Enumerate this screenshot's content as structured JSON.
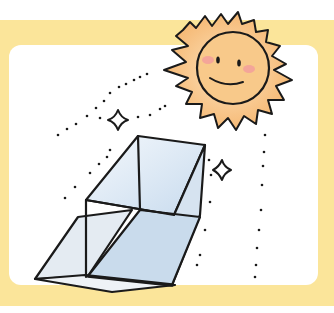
{
  "illustration": {
    "subject": "solar-cooker",
    "elements": [
      "sun",
      "sunlight-rays",
      "sparkles",
      "reflector-box"
    ],
    "colors": {
      "frame": "#fbe59a",
      "background": "#ffffff",
      "sun_fill": "#f8c98a",
      "sun_cheek": "#f29c9c",
      "box_fill": "#dfe9f3",
      "box_inner": "#c9dbec",
      "outline": "#1a1a1a"
    }
  }
}
